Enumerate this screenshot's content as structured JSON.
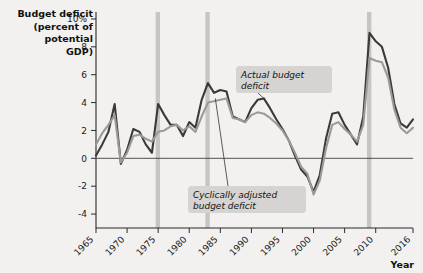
{
  "chart_data": {
    "type": "line",
    "title": "",
    "ylabel": "Budget deficit (percent of potential GDP)",
    "xlabel": "Year",
    "ylabel_lines": [
      "Budget deficit",
      "(percent of",
      "potential",
      "GDP)"
    ],
    "xlim": [
      1965,
      2016
    ],
    "ylim": [
      -5,
      10.5
    ],
    "yticks": [
      10,
      8,
      6,
      4,
      2,
      0,
      -2,
      -4
    ],
    "ytick_labels": [
      "10%",
      "8",
      "6",
      "4",
      "2",
      "0",
      "-2",
      "-4"
    ],
    "xticks": [
      1965,
      1970,
      1975,
      1980,
      1985,
      1990,
      1995,
      2000,
      2005,
      2010,
      2016
    ],
    "xtick_labels": [
      "1965",
      "1970",
      "1975",
      "1980",
      "1985",
      "1990",
      "1995",
      "2000",
      "2005",
      "2010",
      "2016"
    ],
    "grid": false,
    "legend_position": "inline-annotations",
    "recession_bands": [
      {
        "start": 1974.6,
        "end": 1975.3
      },
      {
        "start": 1982.6,
        "end": 1983.3
      },
      {
        "start": 2008.6,
        "end": 2009.3
      }
    ],
    "annotations": [
      {
        "name": "actual-budget-deficit",
        "text": "Actual budget deficit",
        "lines": [
          "Actual budget",
          "deficit"
        ],
        "target_x": 1992,
        "target_y": 4.3
      },
      {
        "name": "cyclically-adjusted-budget-deficit",
        "text": "Cyclically adjusted budget deficit",
        "lines": [
          "Cyclically adjusted",
          "budget deficit"
        ],
        "target_x": 1984.2,
        "target_y": 4.3
      }
    ],
    "x": [
      1965,
      1966,
      1967,
      1968,
      1969,
      1970,
      1971,
      1972,
      1973,
      1974,
      1975,
      1976,
      1977,
      1978,
      1979,
      1980,
      1981,
      1982,
      1983,
      1984,
      1985,
      1986,
      1987,
      1988,
      1989,
      1990,
      1991,
      1992,
      1993,
      1994,
      1995,
      1996,
      1997,
      1998,
      1999,
      2000,
      2001,
      2002,
      2003,
      2004,
      2005,
      2006,
      2007,
      2008,
      2009,
      2010,
      2011,
      2012,
      2013,
      2014,
      2015,
      2016
    ],
    "series": [
      {
        "name": "Actual budget deficit",
        "color": "#3a3a3a",
        "values": [
          0.2,
          1.0,
          1.9,
          3.9,
          -0.4,
          0.6,
          2.1,
          1.9,
          1.0,
          0.4,
          3.9,
          3.1,
          2.4,
          2.4,
          1.6,
          2.6,
          2.2,
          4.2,
          5.4,
          4.7,
          4.9,
          4.8,
          3.0,
          2.8,
          2.6,
          3.6,
          4.2,
          4.3,
          3.6,
          2.8,
          2.1,
          1.3,
          0.2,
          -0.8,
          -1.3,
          -2.4,
          -1.2,
          1.4,
          3.2,
          3.3,
          2.4,
          1.7,
          1.0,
          3.0,
          9.0,
          8.4,
          8.0,
          6.5,
          3.9,
          2.5,
          2.2,
          2.8
        ]
      },
      {
        "name": "Cyclically adjusted budget deficit",
        "color": "#9a9a9a",
        "values": [
          1.0,
          1.8,
          2.4,
          3.1,
          -0.3,
          0.4,
          1.6,
          1.7,
          1.4,
          1.2,
          1.9,
          2.0,
          2.3,
          2.4,
          2.0,
          2.3,
          1.9,
          3.0,
          4.0,
          4.1,
          4.2,
          4.3,
          2.9,
          2.8,
          2.6,
          3.1,
          3.3,
          3.2,
          2.9,
          2.5,
          2.0,
          1.3,
          0.4,
          -0.6,
          -1.1,
          -2.6,
          -1.6,
          0.7,
          2.4,
          2.6,
          2.1,
          1.7,
          1.2,
          2.4,
          7.2,
          7.0,
          6.9,
          5.8,
          3.5,
          2.2,
          1.8,
          2.2
        ]
      }
    ]
  }
}
